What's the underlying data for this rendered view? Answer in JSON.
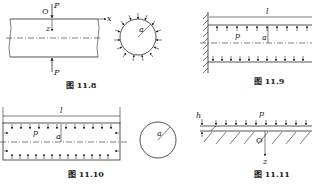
{
  "figures": [
    {
      "id": "fig-11-8",
      "caption": "图 11.8",
      "labels": {
        "origin": "O",
        "force_top": "P",
        "force_bottom": "P",
        "x_axis": "x",
        "z_axis": "z",
        "radius": "a"
      }
    },
    {
      "id": "fig-11-9",
      "caption": "图 11.9",
      "labels": {
        "length": "l",
        "pressure": "p",
        "radius": "a"
      }
    },
    {
      "id": "fig-11-10",
      "caption": "图 11.10",
      "labels": {
        "length": "l",
        "pressure": "p",
        "radius": "a",
        "circle_radius": "a"
      }
    },
    {
      "id": "fig-11-11",
      "caption": "图 11.11",
      "labels": {
        "thickness": "h",
        "pressure": "p",
        "origin": "O",
        "z_axis": "z"
      }
    }
  ]
}
